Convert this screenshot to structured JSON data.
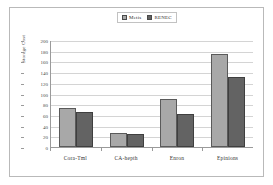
{
  "chart_data": {
    "type": "bar",
    "title": "",
    "xlabel": "",
    "ylabel": "Storage Cost",
    "categories": [
      "Cora-Tml",
      "CA-hepth",
      "Enron",
      "Epinions"
    ],
    "series": [
      {
        "name": "Metis",
        "color": "#a8a8a8",
        "values": [
          72,
          26,
          90,
          174
        ]
      },
      {
        "name": "RENEC",
        "color": "#636363",
        "values": [
          65,
          25,
          61,
          130
        ]
      }
    ],
    "ylim": [
      0,
      200
    ],
    "ytick_step": 20,
    "yticks": [
      200,
      180,
      160,
      140,
      120,
      100,
      80,
      60,
      40,
      20,
      0
    ],
    "grid": "horizontal",
    "legend_position": "top-center"
  }
}
